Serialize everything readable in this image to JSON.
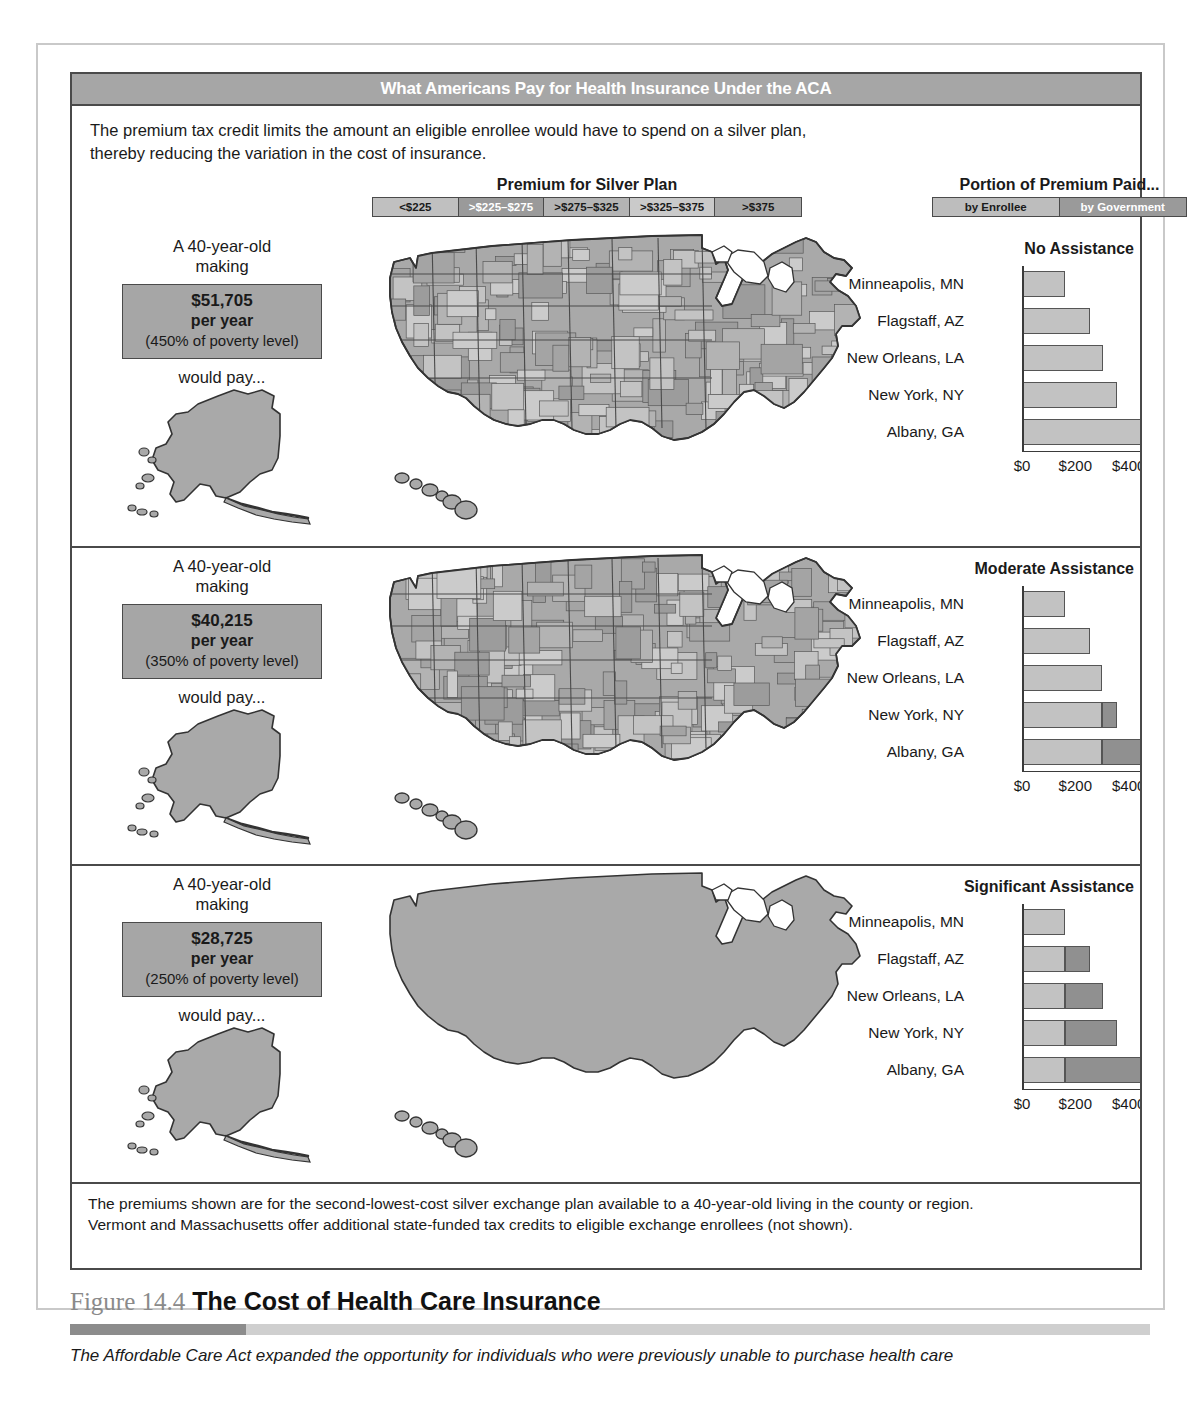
{
  "figure": {
    "title_bar": "What Americans Pay for Health Insurance Under the ACA",
    "intro_line1": "The premium tax credit limits the amount an eligible enrollee would have to spend on a silver plan,",
    "intro_line2": "thereby reducing the variation in the cost of insurance.",
    "footnote_line1": "The premiums shown are for the second-lowest-cost silver exchange plan available to a 40-year-old living in the county or region.",
    "footnote_line2": "Vermont and Massachusetts offer additional state-funded tax credits to eligible exchange enrollees (not shown)."
  },
  "caption": {
    "figure_number": "Figure 14.4",
    "title": "The Cost of Health Care Insurance",
    "body": "The Affordable Care Act expanded the opportunity for individuals who were previously unable to purchase health care"
  },
  "legends": {
    "premium": {
      "heading": "Premium for Silver Plan",
      "items": [
        {
          "label": "<$225",
          "color": "#c0c0c0",
          "text_color": "#1a1a1a"
        },
        {
          "label": ">$225–$275",
          "color": "#9a9a9a",
          "text_color": "#ffffff"
        },
        {
          "label": ">$275–$325",
          "color": "#b4b4b4",
          "text_color": "#1a1a1a"
        },
        {
          "label": ">$325–$375",
          "color": "#cacaca",
          "text_color": "#1a1a1a"
        },
        {
          "label": ">$375",
          "color": "#a8a8a8",
          "text_color": "#1a1a1a"
        }
      ]
    },
    "portion": {
      "heading": "Portion of Premium Paid...",
      "items": [
        {
          "label": "by Enrollee",
          "color": "#bdbdbd",
          "text_color": "#1a1a1a"
        },
        {
          "label": "by Government",
          "color": "#9a9a9a",
          "text_color": "#ffffff"
        }
      ]
    }
  },
  "colors": {
    "enrollee": "#c2c2c2",
    "government": "#909090",
    "title_bar_bg": "#a6a6a6",
    "income_box_bg": "#a6a6a6",
    "map_fill": "#a9a9a9",
    "border": "#4a4a4a"
  },
  "panels": [
    {
      "id": "no-assistance",
      "lead_line1": "A 40-year-old",
      "lead_line2": "making",
      "income_amount": "$51,705",
      "income_period": "per year",
      "income_note": "(450% of poverty level)",
      "would_pay": "would pay...",
      "chart_title": "No Assistance",
      "map_variegated": true
    },
    {
      "id": "moderate-assistance",
      "lead_line1": "A 40-year-old",
      "lead_line2": "making",
      "income_amount": "$40,215",
      "income_period": "per year",
      "income_note": "(350% of poverty level)",
      "would_pay": "would pay...",
      "chart_title": "Moderate Assistance",
      "map_variegated": true
    },
    {
      "id": "significant-assistance",
      "lead_line1": "A 40-year-old",
      "lead_line2": "making",
      "income_amount": "$28,725",
      "income_period": "per year",
      "income_note": "(250% of poverty level)",
      "would_pay": "would pay...",
      "chart_title": "Significant Assistance",
      "map_variegated": false
    }
  ],
  "chart_data": [
    {
      "type": "bar",
      "title": "No Assistance",
      "subtitle": "A 40-year-old making $51,705 per year (450% of poverty level) would pay...",
      "orientation": "horizontal",
      "stacked": true,
      "categories": [
        "Minneapolis, MN",
        "Flagstaff, AZ",
        "New Orleans, LA",
        "New York, NY",
        "Albany, GA"
      ],
      "series": [
        {
          "name": "by Enrollee",
          "values": [
            162,
            254,
            305,
            355,
            482
          ]
        },
        {
          "name": "by Government",
          "values": [
            0,
            0,
            0,
            0,
            0
          ]
        }
      ],
      "xlabel": "",
      "ylabel": "",
      "xlim": [
        0,
        600
      ],
      "xticks": [
        0,
        200,
        400,
        600
      ],
      "xticklabels": [
        "$0",
        "$200",
        "$400",
        "$600"
      ],
      "grid": false,
      "legend": "top-right"
    },
    {
      "type": "bar",
      "title": "Moderate Assistance",
      "subtitle": "A 40-year-old making $40,215 per year (350% of poverty level) would pay...",
      "orientation": "horizontal",
      "stacked": true,
      "categories": [
        "Minneapolis, MN",
        "Flagstaff, AZ",
        "New Orleans, LA",
        "New York, NY",
        "Albany, GA"
      ],
      "series": [
        {
          "name": "by Enrollee",
          "values": [
            162,
            254,
            300,
            300,
            300
          ]
        },
        {
          "name": "by Government",
          "values": [
            0,
            0,
            0,
            55,
            182
          ]
        }
      ],
      "xlabel": "",
      "ylabel": "",
      "xlim": [
        0,
        600
      ],
      "xticks": [
        0,
        200,
        400,
        600
      ],
      "xticklabels": [
        "$0",
        "$200",
        "$400",
        "$600"
      ],
      "grid": false,
      "legend": "top-right"
    },
    {
      "type": "bar",
      "title": "Significant Assistance",
      "subtitle": "A 40-year-old making $28,725 per year (250% of poverty level) would pay...",
      "orientation": "horizontal",
      "stacked": true,
      "categories": [
        "Minneapolis, MN",
        "Flagstaff, AZ",
        "New Orleans, LA",
        "New York, NY",
        "Albany, GA"
      ],
      "series": [
        {
          "name": "by Enrollee",
          "values": [
            160,
            160,
            160,
            160,
            160
          ]
        },
        {
          "name": "by Government",
          "values": [
            0,
            94,
            145,
            195,
            322
          ]
        }
      ],
      "xlabel": "",
      "ylabel": "",
      "xlim": [
        0,
        600
      ],
      "xticks": [
        0,
        200,
        400,
        600
      ],
      "xticklabels": [
        "$0",
        "$200",
        "$400",
        "$600"
      ],
      "grid": false,
      "legend": "top-right"
    }
  ]
}
